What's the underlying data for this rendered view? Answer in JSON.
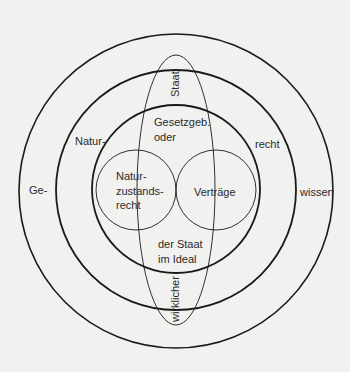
{
  "diagram": {
    "colors": {
      "background": "#f1f1ef",
      "stroke": "#1a1a1a"
    },
    "rings": {
      "outer": {
        "left": "Ge-",
        "right": "wissen"
      },
      "middle": {
        "left": "Natur-",
        "right": "recht"
      },
      "inner": {
        "top_line1": "Gesetzgeb.",
        "top_line2": "oder",
        "bottom_line1": "der Staat",
        "bottom_line2": "im Ideal"
      }
    },
    "circles": {
      "left": {
        "line1": "Natur-",
        "line2": "zustands-",
        "line3": "recht"
      },
      "right": {
        "label": "Verträge"
      }
    },
    "ellipse": {
      "top": "Staat",
      "bottom": "wirklicher"
    }
  }
}
